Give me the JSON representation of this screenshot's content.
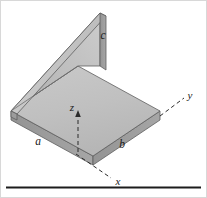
{
  "figure": {
    "background_color": "#ffffff",
    "frame_border_color": "#d8d8d8",
    "base_rule_color": "#1c1c1c"
  },
  "axes": [
    {
      "key": "x",
      "label": "x",
      "label_x": 117,
      "label_y": 183,
      "dash_from": [
        74,
        152
      ],
      "dash_to": [
        110,
        177
      ]
    },
    {
      "key": "y",
      "label": "y",
      "label_x": 191,
      "label_y": 100,
      "dash_from": [
        158,
        116
      ],
      "dash_to": [
        184,
        97
      ]
    },
    {
      "key": "z",
      "label": "z",
      "label_x": 73,
      "label_y": 112,
      "dash_from": [
        78,
        152
      ],
      "dash_to": [
        78,
        113
      ]
    }
  ],
  "dimensions": [
    {
      "key": "a",
      "label": "a",
      "label_x": 38,
      "label_y": 143
    },
    {
      "key": "b",
      "label": "b",
      "label_x": 121,
      "label_y": 147
    },
    {
      "key": "c",
      "label": "c",
      "label_x": 101,
      "label_y": 37
    }
  ],
  "colors": {
    "top_face": "#bfbfbf",
    "top_face_light": "#c9c9c9",
    "vertical_face": "#b4b4b4",
    "vertical_face_light": "#cfcfcf",
    "edge_face_dark": "#8f8f8f",
    "edge_face_mid": "#a3a3a3",
    "edge_stroke": "#5e5e5e",
    "axis_stroke": "#2b2b2b"
  },
  "geometry": {
    "horizontal_plate": {
      "top_face": "11,111 78,66 160,111 93,156",
      "front_right_face": "93,156 160,111 160,120 93,165",
      "front_left_face": "11,111 93,156 93,165 11,120",
      "thickness_px": 9
    },
    "vertical_plate": {
      "front_face": "11,111 78,66 100,13 100,66",
      "inner_face": "11,111 78,66 78,66 11,111",
      "top_edge_face": "11,111 100,13 106,16 17,114",
      "right_edge_face": "100,13 106,16 106,70 100,66",
      "height_px": 98
    }
  }
}
